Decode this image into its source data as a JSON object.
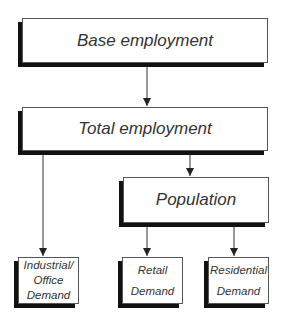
{
  "diagram": {
    "nodes": {
      "base_employment": "Base employment",
      "total_employment": "Total employment",
      "population": "Population",
      "industrial_office_demand": [
        "Industrial/",
        "Office",
        "Demand"
      ],
      "retail_demand": [
        "Retail",
        "Demand"
      ],
      "residential_demand": [
        "Residential",
        "Demand"
      ]
    },
    "edges": [
      {
        "from": "Base employment",
        "to": "Total employment"
      },
      {
        "from": "Total employment",
        "to": "Industrial/Office Demand"
      },
      {
        "from": "Total employment",
        "to": "Population"
      },
      {
        "from": "Population",
        "to": "Retail Demand"
      },
      {
        "from": "Population",
        "to": "Residential Demand"
      }
    ]
  }
}
